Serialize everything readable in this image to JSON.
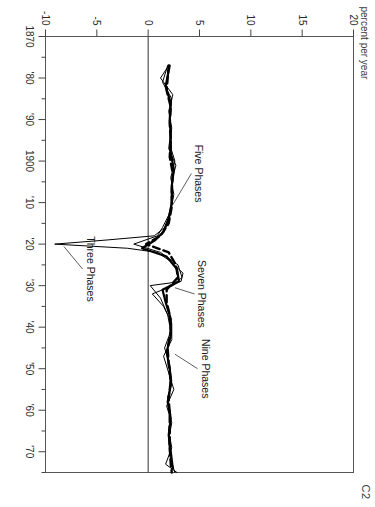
{
  "figure": {
    "tag": "C2",
    "axis_label": "percent per year"
  },
  "chart_data": {
    "type": "line",
    "title": "",
    "subtitle": "",
    "xlabel": "",
    "ylabel": "percent per year",
    "xlim": [
      1870,
      1975
    ],
    "ylim": [
      -10,
      20
    ],
    "grid": false,
    "legend": "annotations on plot",
    "zero_line": 0,
    "xtick_labels": [
      "1870",
      "'80",
      "'90",
      "1900",
      "'10",
      "'20",
      "'30",
      "'40",
      "'50",
      "'60",
      "'70"
    ],
    "xtick_values": [
      1870,
      1880,
      1890,
      1900,
      1910,
      1920,
      1930,
      1940,
      1950,
      1960,
      1970
    ],
    "xminor_values": [
      1875,
      1885,
      1895,
      1905,
      1915,
      1925,
      1935,
      1945,
      1955,
      1965,
      1975
    ],
    "ytick_labels": [
      "20",
      "15",
      "10",
      "5",
      "0",
      "-5",
      "-10"
    ],
    "ytick_values": [
      20,
      15,
      10,
      5,
      0,
      -5,
      -10
    ],
    "annotations": [
      {
        "text": "Three Phases",
        "x": 1926,
        "y": -6.0
      },
      {
        "text": "Five Phases",
        "x": 1903,
        "y": 4.6
      },
      {
        "text": "Seven Phases",
        "x": 1932,
        "y": 4.9
      },
      {
        "text": "Nine Phases",
        "x": 1950,
        "y": 5.2
      }
    ],
    "series": [
      {
        "name": "Three Phases",
        "style": "solid-thin",
        "x": [
          1877,
          1880,
          1884,
          1888,
          1892,
          1896,
          1900,
          1904,
          1908,
          1912,
          1916,
          1918,
          1919,
          1920,
          1921,
          1922,
          1924,
          1927,
          1929,
          1930,
          1933,
          1937,
          1941,
          1945,
          1949,
          1953,
          1957,
          1961,
          1965,
          1969,
          1973,
          1975
        ],
        "values": [
          2.0,
          1.2,
          2.4,
          2.0,
          2.3,
          2.1,
          2.6,
          2.2,
          2.5,
          2.2,
          1.6,
          0.6,
          -4.0,
          -9.1,
          -2.0,
          0.9,
          2.1,
          3.4,
          3.2,
          0.2,
          1.2,
          1.9,
          2.2,
          1.6,
          2.1,
          2.3,
          1.9,
          2.2,
          2.0,
          2.3,
          1.7,
          2.8
        ]
      },
      {
        "name": "Five Phases",
        "style": "solid-thin",
        "x": [
          1877,
          1881,
          1885,
          1889,
          1893,
          1897,
          1901,
          1905,
          1909,
          1913,
          1916,
          1918,
          1920,
          1922,
          1925,
          1928,
          1930,
          1932,
          1935,
          1939,
          1943,
          1947,
          1951,
          1955,
          1959,
          1963,
          1967,
          1971,
          1975
        ],
        "values": [
          1.9,
          1.4,
          2.3,
          2.1,
          2.2,
          2.0,
          2.7,
          2.3,
          2.4,
          2.0,
          1.4,
          0.9,
          -1.4,
          1.2,
          2.9,
          3.3,
          2.4,
          0.4,
          1.5,
          2.3,
          2.3,
          1.5,
          2.0,
          2.5,
          1.8,
          2.3,
          2.0,
          2.1,
          2.6
        ]
      },
      {
        "name": "Seven Phases",
        "style": "solid-thick",
        "x": [
          1877,
          1882,
          1886,
          1890,
          1894,
          1898,
          1902,
          1906,
          1910,
          1914,
          1917,
          1919,
          1921,
          1923,
          1926,
          1929,
          1931,
          1934,
          1938,
          1942,
          1946,
          1950,
          1954,
          1958,
          1962,
          1966,
          1970,
          1974
        ],
        "values": [
          2.1,
          1.7,
          2.2,
          2.1,
          2.2,
          2.2,
          2.5,
          2.3,
          2.3,
          2.0,
          1.5,
          0.7,
          -0.6,
          1.8,
          2.8,
          3.0,
          1.4,
          1.7,
          2.2,
          2.2,
          1.8,
          2.1,
          2.2,
          1.9,
          2.2,
          2.0,
          2.2,
          2.4
        ]
      },
      {
        "name": "Nine Phases",
        "style": "dashed-thick",
        "x": [
          1877,
          1883,
          1887,
          1891,
          1895,
          1899,
          1903,
          1907,
          1911,
          1915,
          1918,
          1920,
          1922,
          1925,
          1928,
          1931,
          1934,
          1937,
          1941,
          1945,
          1949,
          1953,
          1957,
          1961,
          1965,
          1969,
          1973,
          1975
        ],
        "values": [
          2.0,
          1.8,
          2.2,
          2.1,
          2.2,
          2.1,
          2.4,
          2.3,
          2.3,
          2.0,
          1.2,
          -0.2,
          2.0,
          2.7,
          2.9,
          1.8,
          1.8,
          2.1,
          2.2,
          1.9,
          2.0,
          2.2,
          2.0,
          2.1,
          2.1,
          2.1,
          2.2,
          2.3
        ]
      }
    ]
  }
}
